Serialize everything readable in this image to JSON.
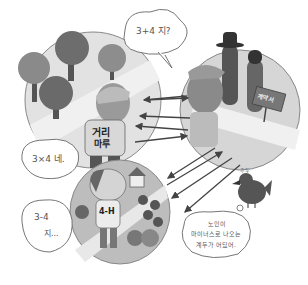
{
  "illustration": {
    "description": "Cartoon: three circular scenes connected by arrows, with thought bubbles of arithmetic",
    "palette": {
      "background": "#ffffff",
      "dark": "#3d3d3d",
      "mid": "#7a7a7a",
      "light": "#c8c8c8",
      "pale": "#e4e4e4",
      "line": "#444444"
    }
  },
  "bubbles": {
    "top": {
      "text": "3+4 지?"
    },
    "left_middle": {
      "text": "3×4 네."
    },
    "left_bottom": {
      "line1": "3-4",
      "line2": "지..."
    },
    "bird": {
      "line1": "노인이",
      "line2": "마이너스로 나오는",
      "line3": "계두가 어딨어."
    }
  },
  "scenes": {
    "forest": {
      "shirt_line1": "거리",
      "shirt_line2": "마루"
    },
    "traders": {
      "sign_text": "계약서"
    },
    "farm": {
      "shirt_text": "4-H"
    }
  },
  "bird": {
    "sound": "후두"
  }
}
